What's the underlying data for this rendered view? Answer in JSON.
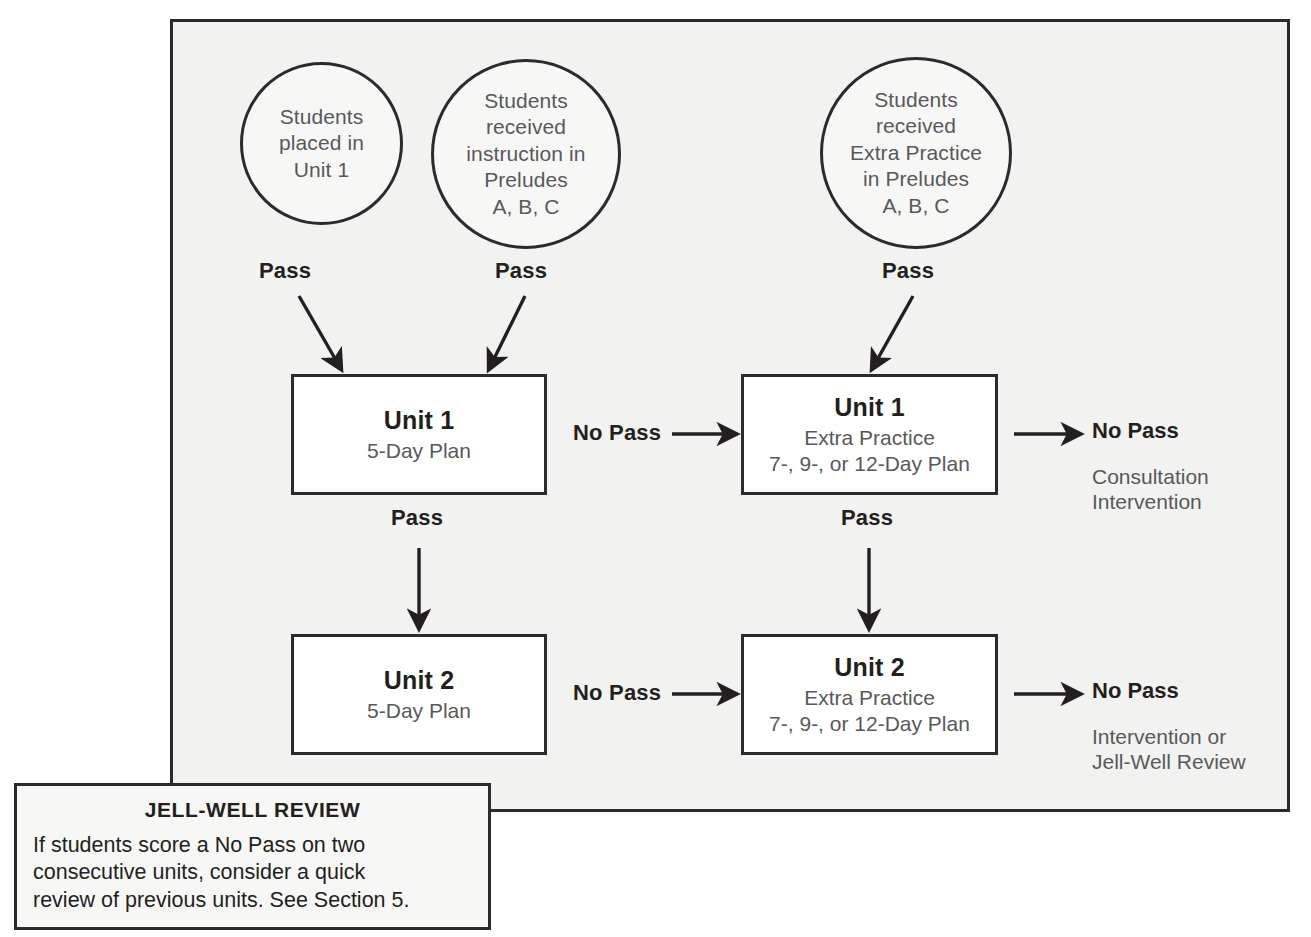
{
  "diagram": {
    "panel_background": "#f2f2f0",
    "border_color": "#2b2b2b",
    "box_fill": "#ffffff",
    "muted_text_color": "#58595b",
    "heading_text_color": "#231f20"
  },
  "circles": [
    {
      "id": "placed-unit-1",
      "text": "Students\nplaced in\nUnit 1"
    },
    {
      "id": "instruction-preludes",
      "text": "Students\nreceived\ninstruction in\nPreludes\nA, B, C"
    },
    {
      "id": "extra-practice-preludes",
      "text": "Students\nreceived\nExtra Practice\nin Preludes\nA, B, C"
    }
  ],
  "circle_edge_labels": [
    {
      "id": "pass-from-placed",
      "text": "Pass"
    },
    {
      "id": "pass-from-instruction",
      "text": "Pass"
    },
    {
      "id": "pass-from-extra-practice",
      "text": "Pass"
    }
  ],
  "boxes": [
    {
      "id": "unit-1-plan",
      "title": "Unit 1",
      "subtitle": "5-Day Plan"
    },
    {
      "id": "unit-1-extra-practice",
      "title": "Unit 1",
      "subtitle": "Extra Practice\n7-, 9-, or 12-Day Plan"
    },
    {
      "id": "unit-2-plan",
      "title": "Unit 2",
      "subtitle": "5-Day Plan"
    },
    {
      "id": "unit-2-extra-practice",
      "title": "Unit 2",
      "subtitle": "Extra Practice\n7-, 9-, or 12-Day Plan"
    }
  ],
  "edge_labels": {
    "unit1_no_pass": "No Pass",
    "unit1_pass_down": "Pass",
    "unit1_ep_pass_down": "Pass",
    "unit2_no_pass": "No Pass"
  },
  "outcomes": [
    {
      "id": "unit-1-no-pass-outcome",
      "heading": "No Pass",
      "body": "Consultation\nIntervention"
    },
    {
      "id": "unit-2-no-pass-outcome",
      "heading": "No Pass",
      "body": "Intervention or\nJell-Well Review"
    }
  ],
  "callout": {
    "title": "JELL-WELL REVIEW",
    "body": "If students score a No Pass on two\nconsecutive units, consider a quick\nreview of previous units. See Section 5."
  }
}
